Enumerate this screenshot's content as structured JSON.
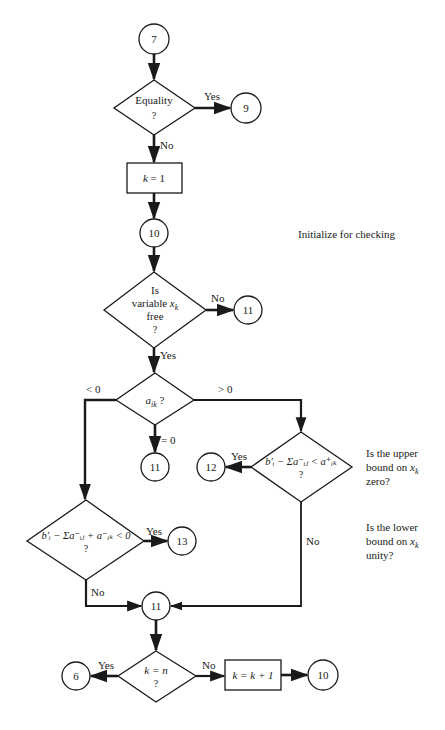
{
  "nodes": {
    "start": {
      "type": "connector",
      "label": "7"
    },
    "equality": {
      "type": "decision",
      "line1": "Equality",
      "line2": "?"
    },
    "to9": {
      "type": "connector",
      "label": "9"
    },
    "init": {
      "type": "process",
      "var": "k",
      "eq": " = 1"
    },
    "c10_top": {
      "type": "connector",
      "label": "10"
    },
    "free": {
      "type": "decision",
      "line1": "Is",
      "line2_prefix": "variable ",
      "line2_var": "x",
      "line2_sub": "k",
      "line3": "free",
      "line4": "?"
    },
    "c11_free": {
      "type": "connector",
      "label": "11"
    },
    "aik": {
      "type": "decision",
      "var": "a",
      "sub": "ik",
      "suffix": " ?"
    },
    "c11_zero": {
      "type": "connector",
      "label": "11"
    },
    "upper": {
      "type": "decision",
      "expr": "b′ᵢ − Σa⁻ᵢⱼ < a⁺ᵢₖ",
      "q": "?"
    },
    "c12": {
      "type": "connector",
      "label": "12"
    },
    "lower": {
      "type": "decision",
      "expr": "b′ᵢ − Σa⁻ᵢⱼ + a⁻ᵢₖ < 0",
      "q": "?"
    },
    "c13": {
      "type": "connector",
      "label": "13"
    },
    "c11_merge": {
      "type": "connector",
      "label": "11"
    },
    "kn": {
      "type": "decision",
      "line1": "k = n",
      "line2": "?"
    },
    "c6": {
      "type": "connector",
      "label": "6"
    },
    "inc": {
      "type": "process",
      "label": "k = k + 1"
    },
    "c10_bottom": {
      "type": "connector",
      "label": "10"
    }
  },
  "edge_labels": {
    "equality_yes": "Yes",
    "equality_no": "No",
    "free_no": "No",
    "free_yes": "Yes",
    "aik_neg": "< 0",
    "aik_pos": "> 0",
    "aik_zero": "= 0",
    "upper_yes": "Yes",
    "upper_no": "No",
    "lower_yes": "Yes",
    "lower_no": "No",
    "kn_yes": "Yes",
    "kn_no": "No"
  },
  "annotations": {
    "init_note": "Initialize for checking",
    "upper_note_1": "Is the upper",
    "upper_note_2": "bound on ",
    "upper_note_3": "zero?",
    "lower_note_1": "Is the lower",
    "lower_note_2": "bound on ",
    "lower_note_3": "unity?",
    "xk_var": "x",
    "xk_sub": "k"
  },
  "colors": {
    "ink": "#1a1a1a",
    "background": "#ffffff"
  }
}
